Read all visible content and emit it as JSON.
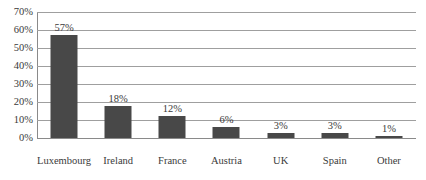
{
  "chart_data": {
    "type": "bar",
    "title": "",
    "xlabel": "",
    "ylabel": "",
    "categories": [
      "Luxembourg",
      "Ireland",
      "France",
      "Austria",
      "UK",
      "Spain",
      "Other"
    ],
    "values": [
      57,
      18,
      12,
      6,
      3,
      3,
      1
    ],
    "data_labels": [
      "57%",
      "18%",
      "12%",
      "6%",
      "3%",
      "3%",
      "1%"
    ],
    "ylim": [
      0,
      70
    ],
    "ytick_values": [
      0,
      10,
      20,
      30,
      40,
      50,
      60,
      70
    ],
    "ytick_labels": [
      "0%",
      "10%",
      "20%",
      "30%",
      "40%",
      "50%",
      "60%",
      "70%"
    ],
    "grid": true,
    "legend": false,
    "legend_position": "none",
    "colors": {
      "bar": "#484848",
      "gridline": "#9f9f9f",
      "axis": "#8a8a8a",
      "text": "#3a3a3a",
      "background": "#ffffff"
    }
  }
}
